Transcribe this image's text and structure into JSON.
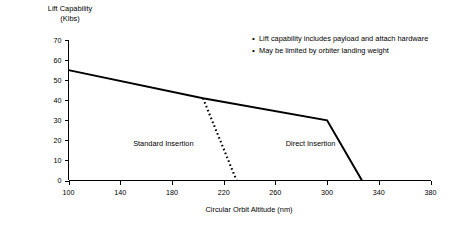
{
  "chart_data": {
    "type": "line",
    "title": "",
    "xlabel": "Circular Orbit Altitude (nm)",
    "ylabel": "Lift Capability\n(Klbs)",
    "ylabel_line1": "Lift Capability",
    "ylabel_line2": "(Klbs)",
    "xlim": [
      100,
      380
    ],
    "ylim": [
      0,
      70
    ],
    "xticks": [
      100,
      140,
      180,
      220,
      260,
      300,
      340,
      380
    ],
    "yticks": [
      0,
      10,
      20,
      30,
      40,
      50,
      60,
      70
    ],
    "grid": false,
    "legend_position": "inline-annotations",
    "series": [
      {
        "name": "Direct Insertion",
        "style": "solid",
        "color": "#000000",
        "label_x": 268,
        "label_y": 17,
        "points": [
          {
            "x": 100,
            "y": 55
          },
          {
            "x": 204,
            "y": 41
          },
          {
            "x": 300,
            "y": 30
          },
          {
            "x": 327,
            "y": 0
          }
        ]
      },
      {
        "name": "Standard Insertion",
        "style": "dotted",
        "color": "#000000",
        "label_x": 150,
        "label_y": 17,
        "points": [
          {
            "x": 204,
            "y": 41
          },
          {
            "x": 230,
            "y": 0
          }
        ]
      }
    ],
    "annotations": [
      "Lift capability includes payload and attach hardware",
      "May be limited by orbiter landing weight"
    ]
  },
  "notes": {
    "bullet_glyph": "•",
    "items": [
      "Lift capability includes payload and attach hardware",
      "May be limited by orbiter landing weight"
    ]
  },
  "axes": {
    "y_title_line1": "Lift Capability",
    "y_title_line2": "(Klbs)",
    "x_title": "Circular Orbit Altitude (nm)"
  },
  "series_labels": {
    "standard": "Standard Insertion",
    "direct": "Direct Insertion"
  },
  "tick_labels": {
    "y": [
      "0",
      "10",
      "20",
      "30",
      "40",
      "50",
      "60",
      "70"
    ],
    "x": [
      "100",
      "140",
      "180",
      "220",
      "260",
      "300",
      "340",
      "380"
    ]
  }
}
